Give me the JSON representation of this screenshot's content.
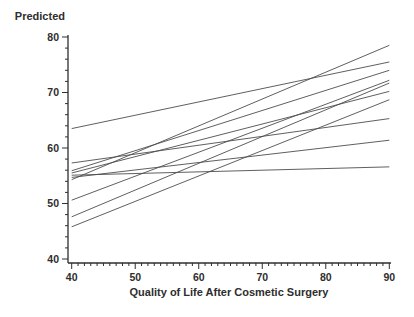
{
  "window": {
    "width": 414,
    "height": 317,
    "background": "#ffffff"
  },
  "chart_data": {
    "type": "line",
    "subtype": "spaghetti-plot-of-fitted-regression-lines",
    "title": "",
    "ylabel": "Predicted",
    "xlabel": "Quality of Life After Cosmetic Surgery",
    "xlim": [
      40,
      90
    ],
    "ylim": [
      40,
      80
    ],
    "x_major_ticks": [
      40,
      50,
      60,
      70,
      80,
      90
    ],
    "x_minor_step": 1,
    "y_major_ticks": [
      40,
      50,
      60,
      70,
      80
    ],
    "y_minor_step": 2,
    "grid": false,
    "legend": false,
    "line_color": "#4d4d4d",
    "axis_color": "#2e2e2e",
    "text_color": "#2e2e2e",
    "series": [
      {
        "name": "line-1",
        "x": [
          40,
          90
        ],
        "y": [
          63.5,
          75.5
        ]
      },
      {
        "name": "line-2",
        "x": [
          40,
          90
        ],
        "y": [
          54.3,
          78.5
        ]
      },
      {
        "name": "line-3",
        "x": [
          40,
          90
        ],
        "y": [
          55.9,
          74.0
        ]
      },
      {
        "name": "line-4",
        "x": [
          40,
          90
        ],
        "y": [
          55.5,
          70.2
        ]
      },
      {
        "name": "line-5",
        "x": [
          40,
          90
        ],
        "y": [
          57.3,
          65.3
        ]
      },
      {
        "name": "line-6",
        "x": [
          40,
          90
        ],
        "y": [
          50.6,
          72.2
        ]
      },
      {
        "name": "line-7",
        "x": [
          40,
          90
        ],
        "y": [
          47.6,
          71.7
        ]
      },
      {
        "name": "line-8",
        "x": [
          40,
          90
        ],
        "y": [
          54.7,
          61.4
        ]
      },
      {
        "name": "line-9",
        "x": [
          40,
          90
        ],
        "y": [
          45.8,
          68.7
        ]
      },
      {
        "name": "line-10",
        "x": [
          40,
          90
        ],
        "y": [
          55.1,
          56.6
        ]
      }
    ]
  }
}
